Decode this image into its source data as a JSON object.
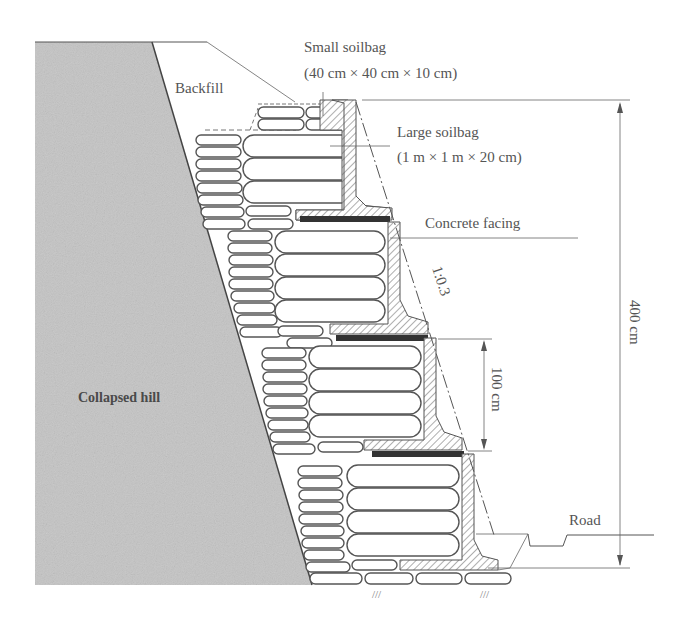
{
  "diagram": {
    "type": "cross-section",
    "labels": {
      "small_soilbag_title": "Small soilbag",
      "small_soilbag_dims": "(40 cm × 40 cm × 10 cm)",
      "large_soilbag_title": "Large soilbag",
      "large_soilbag_dims": "(1 m × 1 m × 20 cm)",
      "backfill": "Backfill",
      "concrete_facing": "Concrete facing",
      "slope": "1:0.3",
      "step_height": "100 cm",
      "total_height": "400 cm",
      "collapsed_hill": "Collapsed hill",
      "road": "Road"
    },
    "colors": {
      "hill_fill": "#c4c4c4",
      "line": "#555555",
      "geogrid": "#333333",
      "background": "#ffffff"
    },
    "tiers": 4
  }
}
